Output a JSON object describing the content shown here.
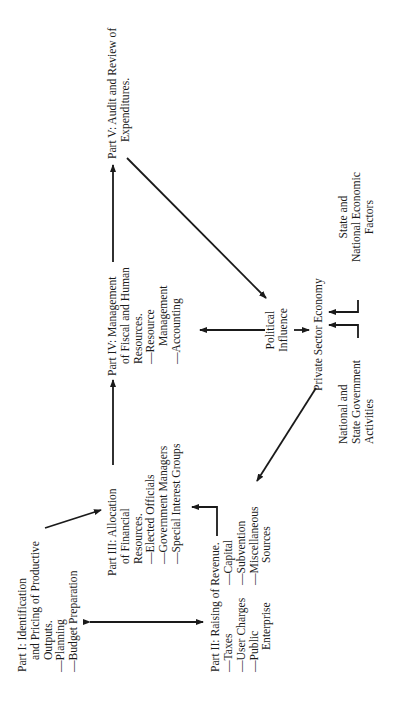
{
  "diagram": {
    "part1": {
      "title_lines": [
        "Part I: Identification",
        "and Pricing of Productive",
        "Outputs."
      ],
      "items": [
        "—Planning",
        "—Budget Preparation"
      ]
    },
    "part2": {
      "title": "Part II: Raising of Revenue.",
      "col1": [
        "—Taxes",
        "—User Charges",
        "—Public",
        "Enterprise"
      ],
      "col2": [
        "—Capital",
        "—Subvention",
        "—Miscellaneous",
        "Sources"
      ]
    },
    "part3": {
      "title_lines": [
        "Part III: Allocation",
        "of Financial",
        "Resources."
      ],
      "items": [
        "—Elected Officials",
        "—Government Managers",
        "—Special Interest Groups"
      ]
    },
    "part4": {
      "title_lines": [
        "Part IV: Management",
        "of Fiscal and Human",
        "Resources."
      ],
      "items": [
        "—Resource",
        "Management",
        "—Accounting"
      ]
    },
    "part5": {
      "title_lines": [
        "Part V: Audit and Review of",
        "Expenditures."
      ]
    },
    "political": [
      "Political",
      "Influence"
    ],
    "private_sector": "Private Sector Economy",
    "national_state": [
      "National and",
      "State Government",
      "Activities"
    ],
    "state_national": [
      "State and",
      "National Economic",
      "Factors"
    ]
  }
}
